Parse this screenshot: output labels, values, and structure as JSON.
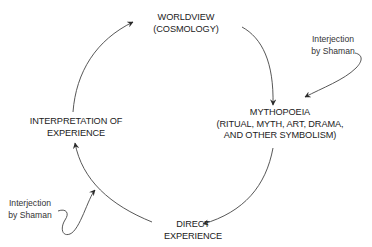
{
  "diagram": {
    "type": "cycle",
    "colors": {
      "stroke": "#333333",
      "text": "#222222",
      "background": "#ffffff"
    },
    "nodes": {
      "worldview": {
        "lines": [
          "WORLDVIEW",
          "(COSMOLOGY)"
        ]
      },
      "mythopoeia": {
        "lines": [
          "MYTHOPOEIA",
          "(RITUAL, MYTH, ART, DRAMA,",
          "AND OTHER SYMBOLISM)"
        ]
      },
      "direct_experience": {
        "lines": [
          "DIRECT",
          "EXPERIENCE"
        ]
      },
      "interpretation": {
        "lines": [
          "INTERPRETATION OF",
          "EXPERIENCE"
        ]
      }
    },
    "annotations": {
      "shaman_right": {
        "lines": [
          "Interjection",
          "by Shaman"
        ],
        "target": "mythopoeia"
      },
      "shaman_left": {
        "lines": [
          "Interjection",
          "by Shaman"
        ],
        "target": "direct_experience-to-interpretation"
      }
    },
    "edges": [
      {
        "from": "interpretation",
        "to": "worldview"
      },
      {
        "from": "worldview",
        "to": "mythopoeia"
      },
      {
        "from": "mythopoeia",
        "to": "direct_experience"
      },
      {
        "from": "direct_experience",
        "to": "interpretation"
      }
    ]
  }
}
